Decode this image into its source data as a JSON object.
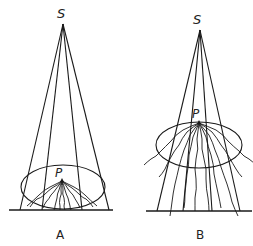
{
  "diagrams": [
    {
      "id": "A",
      "label": "A",
      "source_label": "S",
      "point_label": "P",
      "source": [
        63,
        24
      ],
      "point": [
        62,
        181
      ],
      "ellipse": {
        "cx": 63,
        "cy": 187,
        "rx": 42,
        "ry": 22
      },
      "ground": {
        "y": 210,
        "x1": 9,
        "x2": 113
      },
      "ray_ends_x": [
        20,
        42,
        82,
        109
      ]
    },
    {
      "id": "B",
      "label": "B",
      "source_label": "S",
      "point_label": "P",
      "source": [
        200,
        30
      ],
      "point": [
        199,
        123
      ],
      "ellipse": {
        "cx": 199,
        "cy": 145,
        "rx": 43,
        "ry": 23
      },
      "ground": {
        "y": 211,
        "x1": 146,
        "x2": 252
      },
      "ray_ends_x": [
        157,
        183,
        212,
        240
      ]
    }
  ]
}
